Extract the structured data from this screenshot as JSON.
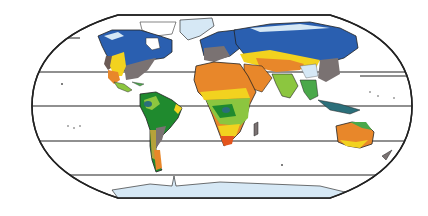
{
  "map": {
    "title": "World climate zones map",
    "projection": "Robinson-like (oval)",
    "latitude_lines_y": [
      38,
      72,
      106,
      141,
      175
    ],
    "colors": {
      "ocean": "#ffffff",
      "outline": "#222222",
      "tundra_ice": "#d6e8f5",
      "boreal_subarctic": "#2a5fb0",
      "cold_continental": "#1f4f9a",
      "temperate_humid": "#7a7272",
      "highland": "#8a7a78",
      "steppe_semi_arid": "#f2d21f",
      "desert_arid": "#e8872a",
      "hot_desert_core": "#e4541c",
      "savanna_tropical_wet_dry": "#8cc63f",
      "tropical_rainforest": "#1f8a2e",
      "tropical_monsoon": "#4aa84a",
      "mediterranean": "#b5a23a",
      "lake": "#2b6f7a"
    },
    "regions": [
      "North America",
      "Greenland",
      "South America",
      "Europe",
      "Africa",
      "Asia",
      "Australia",
      "Antarctica",
      "Maritime Southeast Asia"
    ]
  }
}
